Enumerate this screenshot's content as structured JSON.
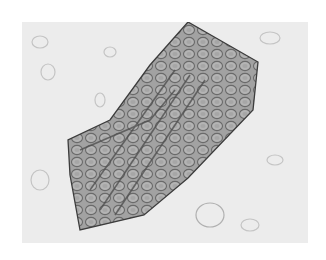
{
  "image": {
    "subject": "micrograph of a cellular tissue fragment",
    "colors": {
      "background": "#ffffff",
      "field": "#ececec",
      "fragment_fill": "#9a9a9a",
      "cell_wall": "#5a5a5a",
      "outline": "#3c3c3c"
    }
  }
}
